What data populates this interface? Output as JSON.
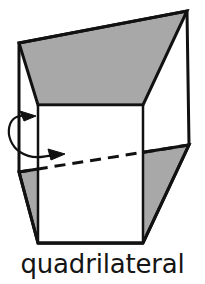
{
  "figure": {
    "caption": "quadrilateral",
    "kind": "3d-solid-diagram",
    "colors": {
      "background": "#ffffff",
      "fill_gray": "#a8a8a8",
      "stroke": "#111111",
      "band_fill": "#ffffff",
      "caption_color": "#151515"
    },
    "geometry": {
      "outline_points": "19,43 187,11 189,145 143,243 38,243 19,172",
      "top_face_points": "19,43 187,11 143,105 38,105",
      "bottom_face_points": "19,172 189,145 143,243 38,243",
      "band_top_y": 105,
      "band_left_x": 38,
      "band_right_x": 143,
      "dashed_edge": {
        "x1": 19,
        "y1": 172,
        "x2": 189,
        "y2": 145
      },
      "left_edge": {
        "x1": 19,
        "y1": 43,
        "x2": 19,
        "y2": 172
      },
      "right_edge": {
        "x1": 187,
        "y1": 11,
        "x2": 189,
        "y2": 145
      },
      "inner_left_vertical": {
        "x1": 38,
        "y1": 105,
        "x2": 38,
        "y2": 243
      },
      "inner_right_vertical": {
        "x1": 143,
        "y1": 105,
        "x2": 143,
        "y2": 243
      },
      "bottom_edge": {
        "x1": 38,
        "y1": 243,
        "x2": 143,
        "y2": 243
      }
    },
    "arrow": {
      "name": "rotation-double-arrow",
      "path": "M 30,117 C 6,109 2,140 20,152 C 32,160 44,157 58,154",
      "head_upper": "36,116 20,111 24,121",
      "head_lower": "65,154 48,149 51,160",
      "direction": "both-ends-point-right"
    }
  }
}
